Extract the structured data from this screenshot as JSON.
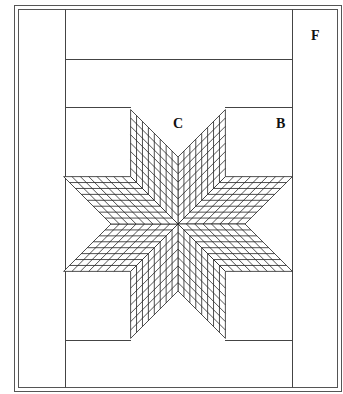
{
  "diagram": {
    "type": "quilt-layout",
    "labels": {
      "F": "F",
      "C": "C",
      "B": "B"
    },
    "star": {
      "points": 8,
      "center": [
        178,
        224
      ],
      "edge_length": 67,
      "grid_divisions": 8
    },
    "colors": {
      "line": "#333333",
      "background": "#ffffff"
    }
  }
}
